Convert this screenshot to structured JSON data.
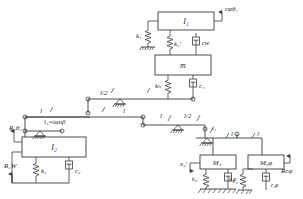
{
  "diagram": {
    "stroke_color": "#3a3a3a",
    "label_color": "#2b2b2b",
    "background": "#ffffff",
    "blocks": [
      {
        "id": "I1",
        "label": "I₁",
        "x": 158,
        "y": 12,
        "w": 56,
        "h": 18
      },
      {
        "id": "m",
        "label": "m",
        "x": 155,
        "y": 55,
        "w": 56,
        "h": 20
      },
      {
        "id": "I2",
        "label": "I₂",
        "x": 22,
        "y": 137,
        "w": 64,
        "h": 20
      },
      {
        "id": "M2x",
        "label": "M₂ₓ",
        "x": 200,
        "y": 155,
        "w": 36,
        "h": 14
      },
      {
        "id": "M2f",
        "label": "M₂φ",
        "x": 248,
        "y": 155,
        "w": 36,
        "h": 14
      }
    ],
    "springs": [
      {
        "id": "k1",
        "label": "k₁",
        "label_x": 140,
        "label_y": 36
      },
      {
        "id": "k1p",
        "label": "k₁′",
        "label_x": 176,
        "label_y": 46
      },
      {
        "id": "kh",
        "label": "kₕ",
        "label_x": 157,
        "label_y": 86
      },
      {
        "id": "k2",
        "label": "k₂",
        "label_x": 44,
        "label_y": 171
      },
      {
        "id": "k2x",
        "label": "k₂ₓ",
        "label_x": 192,
        "label_y": 179
      },
      {
        "id": "k2f",
        "label": "k₂φ",
        "label_x": 229,
        "label_y": 179
      }
    ],
    "dampers": [
      {
        "id": "cw",
        "label": "cᴡ",
        "label_x": 195,
        "label_y": 45
      },
      {
        "id": "c1",
        "label": "c₁",
        "label_x": 193,
        "label_y": 86
      },
      {
        "id": "c2",
        "label": "c₂",
        "label_x": 75,
        "label_y": 171
      },
      {
        "id": "c2x",
        "label": "c₂ₓ",
        "label_x": 218,
        "label_y": 182
      },
      {
        "id": "c2f",
        "label": "c₂φ",
        "label_x": 272,
        "label_y": 186
      }
    ],
    "ratio_labels": [
      {
        "id": "i2",
        "label": "i₂=tanβ",
        "x": 52,
        "y": 123
      },
      {
        "id": "i1",
        "label": "i₁",
        "x": 212,
        "y": 128
      }
    ],
    "length_labels": [
      {
        "id": "len-l-a",
        "label": "l",
        "x": 42,
        "y": 118
      },
      {
        "id": "len-l2-top",
        "label": "l/2",
        "x": 104,
        "y": 97
      },
      {
        "id": "len-l-mid",
        "label": "l",
        "x": 127,
        "y": 119
      },
      {
        "id": "len-l-b",
        "label": "l",
        "x": 164,
        "y": 119
      },
      {
        "id": "len-l2-b",
        "label": "l/2",
        "x": 188,
        "y": 119
      },
      {
        "id": "len-l-c",
        "label": "l",
        "x": 228,
        "y": 143
      },
      {
        "id": "len-l-d",
        "label": "l",
        "x": 251,
        "y": 143
      }
    ],
    "io_labels": [
      {
        "id": "ctheta1",
        "label": "cφθ₁",
        "x": 219,
        "y": 10
      },
      {
        "id": "r2theta",
        "label": "R₂θ̇₂",
        "x": 10,
        "y": 130
      },
      {
        "id": "r2w",
        "label": "R₂W",
        "x": 6,
        "y": 168
      },
      {
        "id": "x2p",
        "label": "x₂′",
        "x": 180,
        "y": 166
      },
      {
        "id": "rcphi",
        "label": "Rcφ",
        "x": 285,
        "y": 167
      }
    ]
  }
}
